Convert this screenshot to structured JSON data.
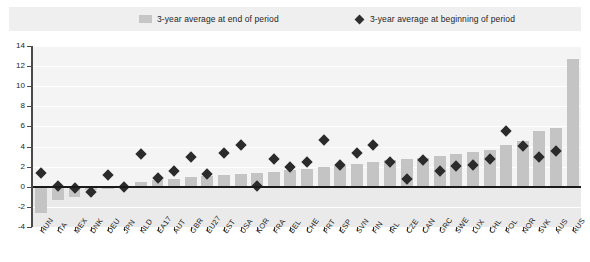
{
  "legend": {
    "bar_label": "3-year average at end of period",
    "marker_label": "3-year average at beginning of period",
    "bar_icon": "square-swatch-icon",
    "marker_icon": "diamond-marker-icon",
    "bar_color": "#c4c4c4",
    "marker_color": "#2b2b2b"
  },
  "chart_data": {
    "type": "bar",
    "title": "",
    "xlabel": "",
    "ylabel": "",
    "ylim": [
      -4,
      14
    ],
    "yticks": [
      -4,
      -2,
      0,
      2,
      4,
      6,
      8,
      10,
      12,
      14
    ],
    "grid": true,
    "legend_position": "top",
    "categories": [
      "HUN",
      "ITA",
      "MEX",
      "DNK",
      "DEU",
      "JPN",
      "NLD",
      "EA17",
      "AUT",
      "GBR",
      "EU27",
      "EST",
      "USA",
      "KOR",
      "FRA",
      "BEL",
      "CHE",
      "PRT",
      "ESP",
      "SVN",
      "FIN",
      "IRL",
      "CZE",
      "CAN",
      "GRC",
      "SWE",
      "LUX",
      "CHL",
      "POL",
      "NOR",
      "SVK",
      "AUS",
      "RUS"
    ],
    "series": [
      {
        "name": "3-year average at end of period",
        "type": "bar",
        "values": [
          -2.6,
          -1.3,
          -1.0,
          -0.3,
          -0.2,
          0.1,
          0.5,
          0.7,
          0.8,
          1.0,
          1.1,
          1.2,
          1.3,
          1.4,
          1.5,
          1.7,
          1.8,
          2.0,
          2.1,
          2.3,
          2.5,
          2.7,
          2.8,
          2.9,
          3.1,
          3.3,
          3.5,
          3.7,
          4.2,
          4.6,
          5.5,
          5.8,
          12.7
        ]
      },
      {
        "name": "3-year average at beginning of period",
        "type": "scatter",
        "values": [
          1.4,
          0.1,
          -0.1,
          -0.5,
          1.2,
          0.0,
          3.3,
          0.9,
          1.6,
          3.0,
          1.3,
          3.4,
          4.2,
          0.1,
          2.8,
          2.0,
          2.5,
          4.7,
          2.2,
          3.4,
          4.2,
          2.5,
          0.8,
          2.7,
          1.6,
          2.1,
          2.2,
          2.8,
          5.5,
          4.1,
          3.0,
          3.6,
          null
        ]
      }
    ]
  }
}
